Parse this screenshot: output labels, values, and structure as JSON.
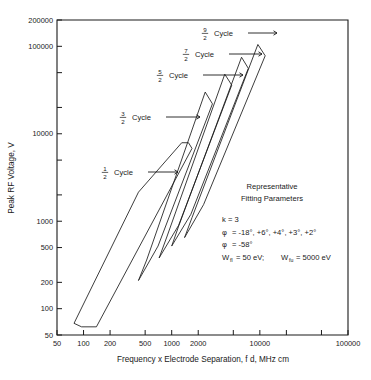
{
  "chart_data": {
    "type": "line",
    "title": "",
    "xlabel": "Frequency x Electrode Separation, f d,  MHz  cm",
    "ylabel": "Peak RF Voltage, V",
    "xscale": "log",
    "yscale": "log",
    "xlim": [
      50,
      100000
    ],
    "ylim": [
      50,
      200000
    ],
    "grid": false,
    "legend_position": "none",
    "xticks": [
      {
        "value": 50,
        "label": "50"
      },
      {
        "value": 100,
        "label": "100"
      },
      {
        "value": 200,
        "label": "200"
      },
      {
        "value": 500,
        "label": "500"
      },
      {
        "value": 1000,
        "label": "1000"
      },
      {
        "value": 2000,
        "label": "2000"
      },
      {
        "value": 5000,
        "label": ""
      },
      {
        "value": 10000,
        "label": "10000"
      },
      {
        "value": 20000,
        "label": ""
      },
      {
        "value": 50000,
        "label": ""
      },
      {
        "value": 100000,
        "label": "100000"
      }
    ],
    "yticks": [
      {
        "value": 50,
        "label": "50"
      },
      {
        "value": 100,
        "label": "100"
      },
      {
        "value": 200,
        "label": "200"
      },
      {
        "value": 500,
        "label": "500"
      },
      {
        "value": 1000,
        "label": "1000"
      },
      {
        "value": 2000,
        "label": ""
      },
      {
        "value": 5000,
        "label": ""
      },
      {
        "value": 10000,
        "label": "10000"
      },
      {
        "value": 20000,
        "label": ""
      },
      {
        "value": 50000,
        "label": ""
      },
      {
        "value": 100000,
        "label": "100000"
      },
      {
        "value": 200000,
        "label": "200000"
      }
    ],
    "series": [
      {
        "name": "1/2 Cycle",
        "label_numerator": "1",
        "label_denominator": "2",
        "label_text": "Cycle",
        "polygon": [
          [
            78,
            68
          ],
          [
            95,
            62
          ],
          [
            140,
            62
          ],
          [
            1700,
            6800
          ],
          [
            1550,
            7900
          ],
          [
            1300,
            7900
          ],
          [
            420,
            2150
          ],
          [
            78,
            68
          ]
        ]
      },
      {
        "name": "3/2 Cycle",
        "label_numerator": "3",
        "label_denominator": "2",
        "label_text": "Cycle",
        "polygon": [
          [
            420,
            210
          ],
          [
            520,
            360
          ],
          [
            2400,
            30000
          ],
          [
            2900,
            22000
          ],
          [
            700,
            520
          ],
          [
            420,
            210
          ]
        ]
      },
      {
        "name": "5/2 Cycle",
        "label_numerator": "5",
        "label_denominator": "2",
        "label_text": "Cycle",
        "polygon": [
          [
            720,
            380
          ],
          [
            880,
            660
          ],
          [
            4000,
            48000
          ],
          [
            4800,
            36000
          ],
          [
            1200,
            900
          ],
          [
            720,
            380
          ]
        ]
      },
      {
        "name": "7/2 Cycle",
        "label_numerator": "7",
        "label_denominator": "2",
        "label_text": "Cycle",
        "polygon": [
          [
            1000,
            520
          ],
          [
            1200,
            880
          ],
          [
            6200,
            75000
          ],
          [
            7400,
            56000
          ],
          [
            1650,
            1200
          ],
          [
            1000,
            520
          ]
        ]
      },
      {
        "name": "9/2 Cycle",
        "label_numerator": "9",
        "label_denominator": "2",
        "label_text": "Cycle",
        "polygon": [
          [
            1400,
            650
          ],
          [
            1700,
            1100
          ],
          [
            9500,
            105000
          ],
          [
            11500,
            78000
          ],
          [
            2300,
            1550
          ],
          [
            1400,
            650
          ]
        ]
      }
    ],
    "annotations": {
      "heading_line1": "Representative",
      "heading_line2": "Fitting Parameters",
      "k_line": "k = 3",
      "phi_symbol": "φ",
      "phi_line_1_rest": "=  -18°, +6°, +4°, +3°, +2°",
      "phi_line_1_values": [
        "-18°",
        "+6°",
        "+4°",
        "+3°",
        "+2°"
      ],
      "phi_line_2_rest": "= -58°",
      "phi_line_2_value": "-58°",
      "w_symbol": "W",
      "w_fl_sub": "fl",
      "w_fl_value": "= 50 eV;",
      "w_fu_sub": "fu",
      "w_fu_value": "= 5000 eV"
    }
  }
}
